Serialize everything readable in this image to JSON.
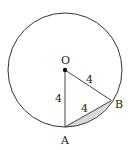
{
  "diagram": {
    "type": "circle-geometry",
    "circle": {
      "center_label": "O",
      "radius_value": "4"
    },
    "points": [
      {
        "name": "O",
        "label": "O"
      },
      {
        "name": "A",
        "label": "A"
      },
      {
        "name": "B",
        "label": "B"
      }
    ],
    "segments": [
      {
        "from": "O",
        "to": "A",
        "length_label": "4"
      },
      {
        "from": "O",
        "to": "B",
        "length_label": "4"
      },
      {
        "from": "A",
        "to": "B",
        "length_label": "4"
      }
    ],
    "shaded_region": "minor segment between chord AB and arc AB",
    "colors": {
      "stroke": "#333333",
      "shade": "#d9d9d9",
      "background": "#ffffff"
    }
  }
}
